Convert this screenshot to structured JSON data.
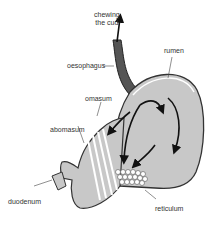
{
  "diagram": {
    "labels": {
      "chewing_line1": "chewing",
      "chewing_line2": "the cud",
      "oesophagus": "oesophagus",
      "rumen": "rumen",
      "omasum": "omasum",
      "abomasum": "abomasum",
      "duodenum": "duodenum",
      "reticulum": "reticulum"
    },
    "colors": {
      "organ_fill": "#c8c8c8",
      "outline": "#333333",
      "arrow": "#111111"
    }
  }
}
